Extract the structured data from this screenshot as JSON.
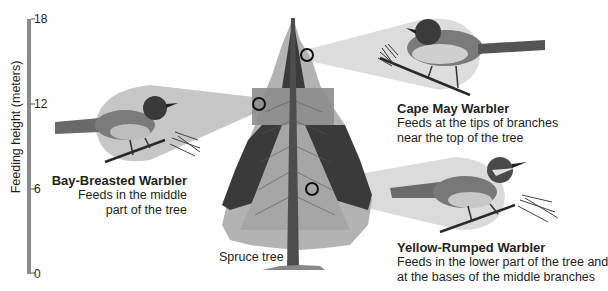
{
  "axis": {
    "title": "Feeding height (meters)",
    "ticks": [
      "18",
      "12",
      "6",
      "0"
    ],
    "range": [
      0,
      18
    ]
  },
  "tree": {
    "label": "Spruce tree"
  },
  "birds": [
    {
      "name": "Cape May Warbler",
      "description_lines": [
        "Feeds at the tips of branches",
        "near the top of the tree"
      ],
      "feeding_zone": "tips of upper branches"
    },
    {
      "name": "Bay-Breasted Warbler",
      "description_lines": [
        "Feeds in the middle",
        "part of the tree"
      ],
      "feeding_zone": "middle band of tree"
    },
    {
      "name": "Yellow-Rumped Warbler",
      "description_lines": [
        "Feeds in the lower part of the tree and",
        "at the bases of the middle branches"
      ],
      "feeding_zone": "lower part and inner middle"
    }
  ],
  "colors": {
    "axis_bar": "#8a8a8a",
    "tree_dark": "#3a3a3a",
    "tree_light": "#b3b3b3",
    "zone_mid": "#8c8c8c",
    "zone_light": "#a6a6a6",
    "callout": "#d9d9d9",
    "trunk": "#4d4d4d"
  }
}
